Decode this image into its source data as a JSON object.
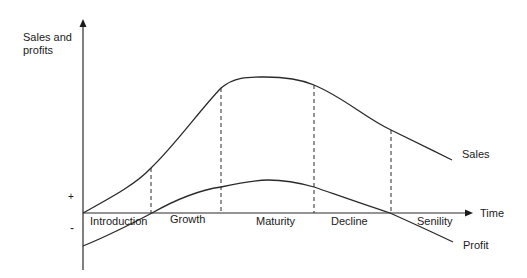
{
  "diagram": {
    "y_axis_label_line1": "Sales and",
    "y_axis_label_line2": "profits",
    "x_axis_label": "Time",
    "plus_sign": "+",
    "minus_sign": "-",
    "stages": [
      {
        "label": "Introduction"
      },
      {
        "label": "Growth"
      },
      {
        "label": "Maturity"
      },
      {
        "label": "Decline"
      },
      {
        "label": "Senility"
      }
    ],
    "curves": [
      {
        "label": "Sales"
      },
      {
        "label": "Profit"
      }
    ],
    "colors": {
      "line": "#2a2a2a",
      "text": "#1a1a1a",
      "background": "#ffffff"
    }
  }
}
